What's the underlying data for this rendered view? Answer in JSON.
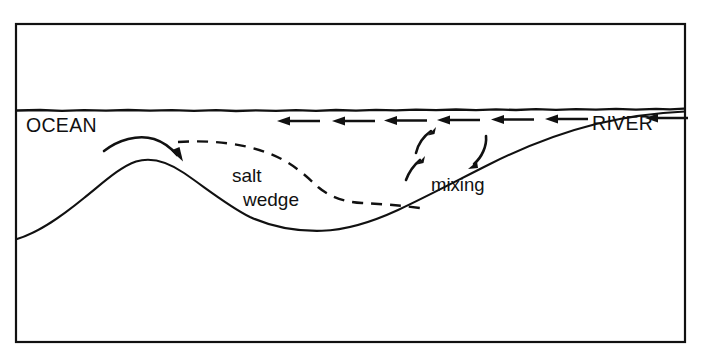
{
  "figure": {
    "background_color": "#ffffff",
    "line_color": "#111111",
    "frame": {
      "x": 15,
      "y": 23,
      "width": 671,
      "height": 320,
      "stroke_width": 2.2
    }
  },
  "labels": {
    "ocean": "OCEAN",
    "river": "RIVER",
    "salt": "salt",
    "wedge": "wedge",
    "mixing": "mixing"
  },
  "features": {
    "water_surface": {
      "name": "water-surface-line",
      "y": 110,
      "description": "wavy horizontal free-surface line spanning the frame"
    },
    "seafloor": {
      "name": "seafloor-profile",
      "left_edge_y": 238,
      "crest": {
        "x": 135,
        "y": 161
      },
      "trough": {
        "x": 330,
        "y": 230
      },
      "right_edge_y": 112
    },
    "salt_wedge_boundary": {
      "name": "salt-wedge-dashed-boundary",
      "start": {
        "x": 178,
        "y": 142
      },
      "end": {
        "x": 424,
        "y": 208
      },
      "dash_pattern": "11 8"
    }
  },
  "surface_arrows": {
    "direction": "left",
    "count": 6,
    "y": 121,
    "segments": [
      {
        "x_tail": 320,
        "x_head": 278
      },
      {
        "x_tail": 375,
        "x_head": 333
      },
      {
        "x_tail": 425,
        "x_head": 383
      },
      {
        "x_tail": 478,
        "x_head": 436
      },
      {
        "x_tail": 532,
        "x_head": 490
      },
      {
        "x_tail": 588,
        "x_head": 546
      }
    ],
    "river_inflow_arrow": {
      "x_tail": 686,
      "x_head": 646,
      "y": 121
    }
  },
  "ocean_outflow_arrow": {
    "name": "ocean-outflow-curved-arrow",
    "start": {
      "x": 105,
      "y": 150
    },
    "end": {
      "x": 180,
      "y": 157
    },
    "direction": "rightward-seaward-return"
  },
  "mixing_arrows": [
    {
      "id": "mix-up-right",
      "start": {
        "x": 416,
        "y": 152
      },
      "end": {
        "x": 434,
        "y": 129
      }
    },
    {
      "id": "mix-up-left",
      "start": {
        "x": 407,
        "y": 178
      },
      "end": {
        "x": 422,
        "y": 158
      }
    },
    {
      "id": "mix-down",
      "start": {
        "x": 485,
        "y": 137
      },
      "end": {
        "x": 470,
        "y": 168
      }
    }
  ],
  "label_positions": {
    "ocean": {
      "x": 26,
      "y": 132
    },
    "river": {
      "x": 592,
      "y": 130
    },
    "salt": {
      "x": 232,
      "y": 181
    },
    "wedge": {
      "x": 243,
      "y": 205
    },
    "mixing": {
      "x": 432,
      "y": 190
    }
  }
}
